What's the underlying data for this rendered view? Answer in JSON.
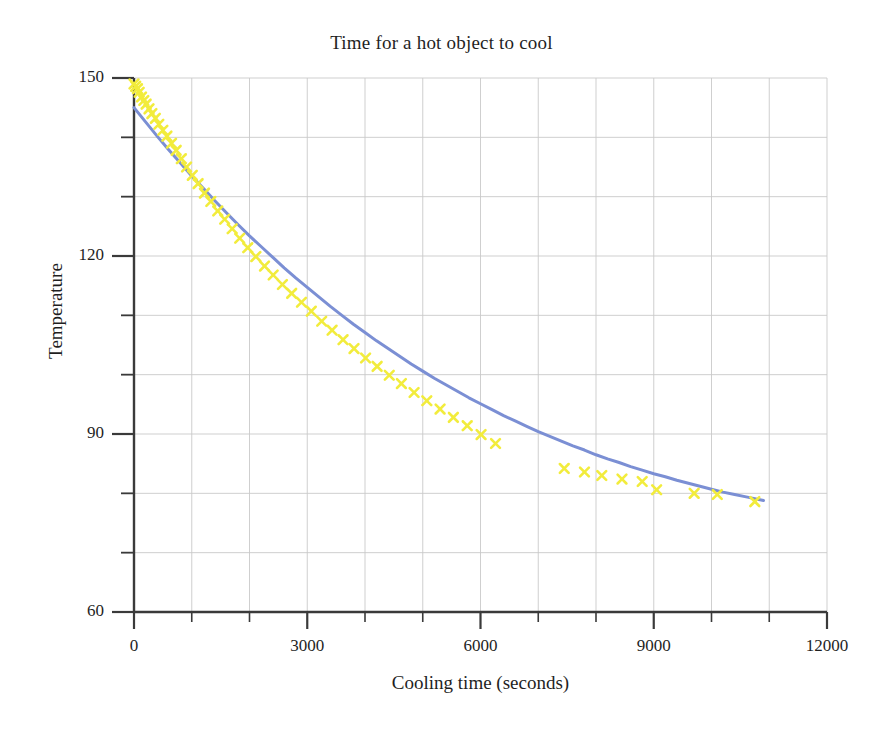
{
  "chart_data": {
    "type": "line",
    "title": "Time for a hot object to cool",
    "xlabel": "Cooling time (seconds)",
    "ylabel": "Temperature",
    "xlim": [
      0,
      12000
    ],
    "ylim": [
      60,
      150
    ],
    "xticks": [
      0,
      3000,
      6000,
      9000,
      12000
    ],
    "yticks": [
      60,
      90,
      120,
      150
    ],
    "xticks_minor_step": 1000,
    "yticks_minor_step": 10,
    "grid": true,
    "legend": "none",
    "series": [
      {
        "name": "fitted cooling curve",
        "type": "line",
        "color": "#7b8fd4",
        "linewidth": 3,
        "x": [
          0,
          200,
          400,
          600,
          800,
          1000,
          1200,
          1400,
          1600,
          1800,
          2000,
          2200,
          2400,
          2600,
          2800,
          3000,
          3200,
          3400,
          3600,
          3800,
          4000,
          4200,
          4400,
          4600,
          4800,
          5000,
          5200,
          5400,
          5600,
          5800,
          6000,
          6200,
          6400,
          6600,
          6800,
          7000,
          7200,
          7400,
          7600,
          7800,
          8000,
          8200,
          8400,
          8600,
          8800,
          9000,
          9200,
          9400,
          9600,
          9800,
          10000,
          10200,
          10400,
          10600,
          10900
        ],
        "y": [
          145.0,
          142.6,
          140.2,
          137.9,
          135.7,
          133.5,
          131.4,
          129.3,
          127.3,
          125.3,
          123.4,
          121.6,
          119.8,
          118.0,
          116.3,
          114.7,
          113.1,
          111.5,
          110.0,
          108.5,
          107.1,
          105.7,
          104.4,
          103.1,
          101.8,
          100.6,
          99.4,
          98.3,
          97.2,
          96.1,
          95.1,
          94.1,
          93.1,
          92.2,
          91.3,
          90.4,
          89.6,
          88.8,
          88.0,
          87.3,
          86.5,
          85.8,
          85.2,
          84.5,
          83.9,
          83.3,
          82.8,
          82.2,
          81.7,
          81.2,
          80.7,
          80.2,
          79.8,
          79.4,
          78.8
        ]
      },
      {
        "name": "measured temperature samples",
        "type": "scatter",
        "marker": "x",
        "color": "#f2ec3c",
        "x": [
          0,
          30,
          60,
          90,
          130,
          170,
          210,
          260,
          310,
          370,
          430,
          500,
          570,
          650,
          730,
          820,
          910,
          1010,
          1110,
          1220,
          1330,
          1450,
          1570,
          1700,
          1830,
          1970,
          2110,
          2260,
          2410,
          2570,
          2730,
          2900,
          3070,
          3250,
          3430,
          3620,
          3810,
          4010,
          4210,
          4420,
          4630,
          4850,
          5070,
          5300,
          5530,
          5770,
          6010,
          6260,
          7450,
          7800,
          8100,
          8450,
          8800,
          9050,
          9700,
          10100,
          10750
        ],
        "y": [
          149.0,
          148.6,
          148.2,
          147.6,
          146.8,
          146.2,
          145.6,
          144.8,
          144.0,
          143.2,
          142.2,
          141.2,
          140.2,
          139.0,
          137.8,
          136.4,
          135.0,
          133.6,
          132.2,
          130.6,
          129.2,
          127.6,
          126.2,
          124.6,
          123.0,
          121.4,
          119.9,
          118.3,
          116.8,
          115.2,
          113.7,
          112.2,
          110.7,
          109.0,
          107.5,
          105.9,
          104.4,
          102.8,
          101.4,
          99.9,
          98.5,
          97.0,
          95.6,
          94.2,
          92.8,
          91.4,
          89.9,
          88.4,
          84.2,
          83.6,
          83.0,
          82.4,
          82.0,
          80.6,
          80.0,
          79.8,
          78.6
        ]
      }
    ],
    "colors": {
      "line": "#7b8fd4",
      "marker": "#f2ec3c",
      "axis": "#3a3a3a",
      "grid": "#c9c9c9",
      "text": "#1f1f1f",
      "background": "#ffffff"
    },
    "axis_px": {
      "left": 134,
      "right": 827,
      "top": 78,
      "bottom": 612
    }
  }
}
